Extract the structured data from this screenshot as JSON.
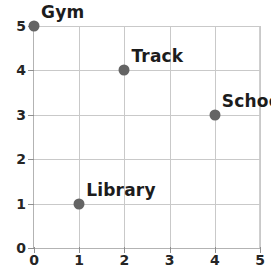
{
  "chart_data": {
    "type": "scatter",
    "title": "",
    "xlabel": "",
    "ylabel": "",
    "xlim": [
      0,
      5
    ],
    "ylim": [
      0,
      5
    ],
    "grid": true,
    "legend": "none",
    "x_ticks": [
      "0",
      "1",
      "2",
      "3",
      "4",
      "5"
    ],
    "y_ticks": [
      "0",
      "1",
      "2",
      "3",
      "4",
      "5"
    ],
    "points": [
      {
        "label": "Gym",
        "x": 0,
        "y": 5
      },
      {
        "label": "Track",
        "x": 2,
        "y": 4
      },
      {
        "label": "School",
        "x": 4,
        "y": 3
      },
      {
        "label": "Library",
        "x": 1,
        "y": 1
      }
    ],
    "colors": {
      "point": "#646464",
      "gridline": "#c9c9c9",
      "axis": "#b3b3b3",
      "text": "#1c1c1c",
      "background": "#ffffff"
    }
  }
}
